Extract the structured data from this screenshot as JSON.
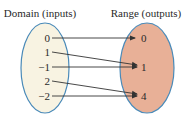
{
  "diagram": {
    "type": "function-mapping",
    "domain": {
      "title": "Domain (inputs)",
      "fill": "#f8f3e2",
      "stroke": "#4a8ab8",
      "values": [
        "0",
        "1",
        "−1",
        "2",
        "−2"
      ]
    },
    "range": {
      "title": "Range (outputs)",
      "fill": "#e8b097",
      "stroke": "#4a8ab8",
      "values": [
        "0",
        "1",
        "4"
      ]
    },
    "mappings": [
      {
        "from": "0",
        "to": "0"
      },
      {
        "from": "1",
        "to": "1"
      },
      {
        "from": "−1",
        "to": "1"
      },
      {
        "from": "2",
        "to": "4"
      },
      {
        "from": "−2",
        "to": "4"
      }
    ],
    "arrow_color": "#333333"
  }
}
